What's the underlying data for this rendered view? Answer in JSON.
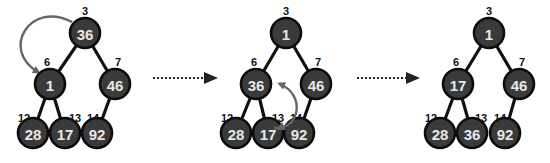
{
  "colors": {
    "node_fill": "#3a3a3a",
    "node_stroke": "#0c0c0c",
    "node_text": "#e8e8e8",
    "edge": "#111111",
    "swap_arrow": "#666666"
  },
  "trees": [
    {
      "nodes": [
        {
          "index": "3",
          "value": "36"
        },
        {
          "index": "6",
          "value": "1"
        },
        {
          "index": "7",
          "value": "46"
        },
        {
          "index": "12",
          "value": "28"
        },
        {
          "index": "13",
          "value": "17"
        },
        {
          "index": "14",
          "value": "92"
        }
      ],
      "swap": [
        "3",
        "6"
      ]
    },
    {
      "nodes": [
        {
          "index": "3",
          "value": "1"
        },
        {
          "index": "6",
          "value": "36"
        },
        {
          "index": "7",
          "value": "46"
        },
        {
          "index": "12",
          "value": "28"
        },
        {
          "index": "13",
          "value": "17"
        },
        {
          "index": "14",
          "value": "92"
        }
      ],
      "swap": [
        "6",
        "13"
      ]
    },
    {
      "nodes": [
        {
          "index": "3",
          "value": "1"
        },
        {
          "index": "6",
          "value": "17"
        },
        {
          "index": "7",
          "value": "46"
        },
        {
          "index": "12",
          "value": "28"
        },
        {
          "index": "13",
          "value": "36"
        },
        {
          "index": "14",
          "value": "92"
        }
      ],
      "swap": []
    }
  ],
  "transitions": [
    "step-arrow-1",
    "step-arrow-2"
  ]
}
